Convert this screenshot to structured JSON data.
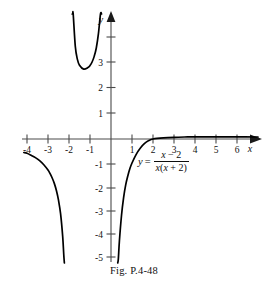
{
  "figure": {
    "caption": "Fig.  P.4-48",
    "background_color": "#ffffff",
    "curve_color": "#000000",
    "axis_color": "#4a4a4a"
  },
  "equation": {
    "lhs": "y",
    "equals": "=",
    "numerator_var": "x",
    "numerator_rest": " − 2",
    "denominator_var1": "x",
    "denominator_open": "(",
    "denominator_var2": "x",
    "denominator_rest": " + 2)",
    "plain": "y = (x - 2) / (x(x + 2))"
  },
  "axes": {
    "x_label": "x",
    "y_label": "y",
    "x_ticks": [
      "-4",
      "-3",
      "-2",
      "-1",
      "1",
      "2",
      "3",
      "4",
      "5",
      "6"
    ],
    "y_ticks": [
      "3",
      "2",
      "1",
      "-1",
      "-2",
      "-3",
      "-4",
      "-5"
    ],
    "xlim": [
      -4.4,
      7.0
    ],
    "ylim": [
      -5.2,
      5.2
    ]
  },
  "chart_data": {
    "type": "line",
    "title": "Fig.  P.4-48",
    "xlabel": "x",
    "ylabel": "y",
    "grid": false,
    "legend": null,
    "xlim": [
      -4.4,
      7.0
    ],
    "ylim": [
      -5.2,
      5.2
    ],
    "xticks": [
      -4,
      -3,
      -2,
      -1,
      1,
      2,
      3,
      4,
      5,
      6
    ],
    "yticks": [
      3,
      2,
      1,
      -1,
      -2,
      -3,
      -4,
      -5
    ],
    "function": "y = (x - 2) / (x * (x + 2))",
    "asymptotes": {
      "vertical": [
        -2,
        0
      ],
      "horizontal": [
        0
      ]
    },
    "x_intercepts": [
      2
    ],
    "series": [
      {
        "name": "left-branch",
        "domain": [
          -4.15,
          -2.22
        ],
        "points": [
          {
            "x": -4.15,
            "y": -0.53
          },
          {
            "x": -4.0,
            "y": -0.56
          },
          {
            "x": -3.8,
            "y": -0.64
          },
          {
            "x": -3.6,
            "y": -0.73
          },
          {
            "x": -3.4,
            "y": -0.85
          },
          {
            "x": -3.2,
            "y": -1.01
          },
          {
            "x": -3.0,
            "y": -1.22
          },
          {
            "x": -2.9,
            "y": -1.36
          },
          {
            "x": -2.8,
            "y": -1.53
          },
          {
            "x": -2.7,
            "y": -1.74
          },
          {
            "x": -2.6,
            "y": -2.02
          },
          {
            "x": -2.5,
            "y": -2.4
          },
          {
            "x": -2.4,
            "y": -2.94
          },
          {
            "x": -2.3,
            "y": -3.83
          },
          {
            "x": -2.25,
            "y": -4.53
          },
          {
            "x": -2.22,
            "y": -5.07
          }
        ]
      },
      {
        "name": "middle-branch",
        "domain": [
          -1.82,
          -0.33
        ],
        "points": [
          {
            "x": -1.82,
            "y": 5.3
          },
          {
            "x": -1.85,
            "y": 6.2
          },
          {
            "x": -1.8,
            "y": 4.94
          },
          {
            "x": -1.7,
            "y": 3.63
          },
          {
            "x": -1.6,
            "y": 3.12
          },
          {
            "x": -1.5,
            "y": 2.89
          },
          {
            "x": -1.3,
            "y": 2.74
          },
          {
            "x": -1.1,
            "y": 2.8
          },
          {
            "x": -1.0,
            "y": 2.88
          },
          {
            "x": -0.9,
            "y": 3.02
          },
          {
            "x": -0.8,
            "y": 3.24
          },
          {
            "x": -0.7,
            "y": 3.57
          },
          {
            "x": -0.6,
            "y": 4.12
          },
          {
            "x": -0.5,
            "y": 5.08
          },
          {
            "x": -0.45,
            "y": 5.8
          }
        ]
      },
      {
        "name": "right-branch",
        "domain": [
          0.32,
          7.0
        ],
        "points": [
          {
            "x": 0.32,
            "y": -5.12
          },
          {
            "x": 0.35,
            "y": -4.7
          },
          {
            "x": 0.4,
            "y": -4.0
          },
          {
            "x": 0.5,
            "y": -3.0
          },
          {
            "x": 0.6,
            "y": -2.3
          },
          {
            "x": 0.7,
            "y": -1.8
          },
          {
            "x": 0.8,
            "y": -1.45
          },
          {
            "x": 0.9,
            "y": -1.16
          },
          {
            "x": 1.0,
            "y": -0.94
          },
          {
            "x": 1.2,
            "y": -0.6
          },
          {
            "x": 1.4,
            "y": -0.35
          },
          {
            "x": 1.6,
            "y": -0.17
          },
          {
            "x": 1.8,
            "y": -0.06
          },
          {
            "x": 2.0,
            "y": 0.0
          },
          {
            "x": 2.5,
            "y": 0.044
          },
          {
            "x": 3.0,
            "y": 0.067
          },
          {
            "x": 3.5,
            "y": 0.078
          },
          {
            "x": 4.0,
            "y": 0.083
          },
          {
            "x": 5.0,
            "y": 0.086
          },
          {
            "x": 6.0,
            "y": 0.083
          },
          {
            "x": 7.0,
            "y": 0.079
          }
        ]
      }
    ]
  }
}
